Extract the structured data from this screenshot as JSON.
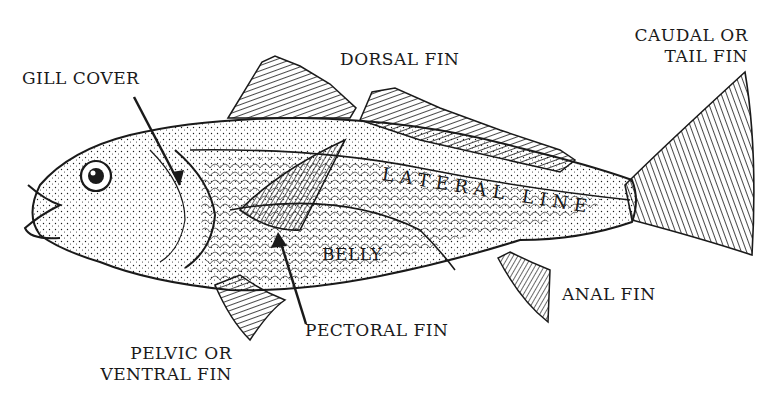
{
  "diagram": {
    "colors": {
      "ink": "#1a1a1a",
      "background": "#ffffff"
    },
    "labels": {
      "gill_cover": "GILL COVER",
      "dorsal_fin": "DORSAL FIN",
      "caudal_line1": "CAUDAL OR",
      "caudal_line2": "TAIL FIN",
      "lateral_line": "LATERAL LINE",
      "belly": "BELLY",
      "anal_fin": "ANAL FIN",
      "pectoral_fin": "PECTORAL FIN",
      "pelvic_line1": "PELVIC OR",
      "pelvic_line2": "VENTRAL FIN"
    }
  }
}
